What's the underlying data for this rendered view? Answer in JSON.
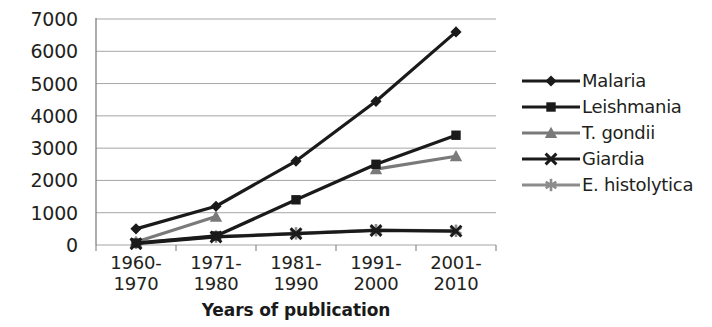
{
  "chart_data": {
    "type": "line",
    "title": "",
    "xlabel": "Years of publication",
    "ylabel": "",
    "categories": [
      "1960-\n1970",
      "1971-\n1980",
      "1981-\n1990",
      "1991-\n2000",
      "2001-\n2010"
    ],
    "category_lines": [
      [
        "1960-",
        "1970"
      ],
      [
        "1971-",
        "1980"
      ],
      [
        "1981-",
        "1990"
      ],
      [
        "1991-",
        "2000"
      ],
      [
        "2001-",
        "2010"
      ]
    ],
    "ylim": [
      0,
      7000
    ],
    "yticks": [
      0,
      1000,
      2000,
      3000,
      4000,
      5000,
      6000,
      7000
    ],
    "ytick_labels": [
      "0",
      "1000",
      "2000",
      "3000",
      "4000",
      "5000",
      "6000",
      "7000"
    ],
    "grid": true,
    "legend_position": "right",
    "series": [
      {
        "name": "Malaria",
        "marker": "diamond",
        "color": "#1a1a1a",
        "values": [
          500,
          1200,
          2600,
          4450,
          6600
        ]
      },
      {
        "name": "Leishmania",
        "marker": "square",
        "color": "#1a1a1a",
        "values": [
          60,
          280,
          1400,
          2500,
          3400
        ]
      },
      {
        "name": "T. gondii",
        "marker": "triangle",
        "color": "#7a7a7a",
        "values": [
          90,
          880,
          null,
          2350,
          2750
        ]
      },
      {
        "name": "Giardia",
        "marker": "x",
        "color": "#1a1a1a",
        "values": [
          40,
          250,
          350,
          450,
          430
        ]
      },
      {
        "name": "E. histolytica",
        "marker": "asterisk",
        "color": "#8c8c8c",
        "values": [
          70,
          260,
          360,
          460,
          440
        ]
      }
    ]
  },
  "legend": {
    "items": [
      {
        "label": "Malaria"
      },
      {
        "label": "Leishmania"
      },
      {
        "label": "T. gondii"
      },
      {
        "label": "Giardia"
      },
      {
        "label": "E. histolytica"
      }
    ]
  },
  "colors": {
    "axis": "#808080",
    "grid": "#a6a6a6",
    "text": "#231f20",
    "dark_series": "#1a1a1a",
    "gray_series": "#8c8c8c"
  }
}
